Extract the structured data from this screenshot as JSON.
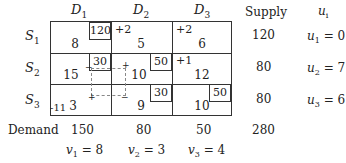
{
  "columns": {
    "d1": "D",
    "d1_sub": "1",
    "d2": "D",
    "d2_sub": "2",
    "d3": "D",
    "d3_sub": "3",
    "supply": "Supply",
    "ui": "u",
    "ui_sub": "i"
  },
  "rows": [
    {
      "label": "S",
      "sub": "1",
      "supply": "120",
      "u": "u",
      "u_sub": "1",
      "u_val": " = 0",
      "cells": [
        {
          "alloc": "120",
          "cost": "8",
          "delta": ""
        },
        {
          "alloc": "",
          "cost": "5",
          "delta": "+2"
        },
        {
          "alloc": "",
          "cost": "6",
          "delta": "+2"
        }
      ]
    },
    {
      "label": "S",
      "sub": "2",
      "supply": "80",
      "u": "u",
      "u_sub": "2",
      "u_val": " = 7",
      "cells": [
        {
          "alloc": "30",
          "cost": "15",
          "delta": ""
        },
        {
          "alloc": "50",
          "cost": "10",
          "delta": ""
        },
        {
          "alloc": "",
          "cost": "12",
          "delta": "+1"
        }
      ]
    },
    {
      "label": "S",
      "sub": "3",
      "supply": "80",
      "u": "u",
      "u_sub": "3",
      "u_val": " = 6",
      "cells": [
        {
          "alloc": "",
          "cost": "3",
          "delta": "-11"
        },
        {
          "alloc": "30",
          "cost": "9",
          "delta": ""
        },
        {
          "alloc": "50",
          "cost": "10",
          "delta": ""
        }
      ]
    }
  ],
  "demand": {
    "label": "Demand",
    "values": [
      "150",
      "80",
      "50"
    ],
    "total": "280"
  },
  "v": [
    {
      "v": "v",
      "sub": "1",
      "val": " = 8"
    },
    {
      "v": "v",
      "sub": "2",
      "val": " = 3"
    },
    {
      "v": "v",
      "sub": "3",
      "val": " = 4"
    }
  ],
  "loop_signs": {
    "s2d1": "−",
    "s2d2": "+",
    "s3d1": "+",
    "s3d2": "−"
  }
}
